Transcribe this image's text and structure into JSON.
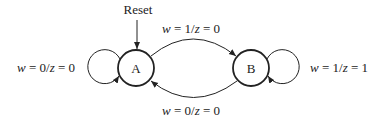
{
  "diagram": {
    "type": "finite-state-machine",
    "reset_label": "Reset",
    "reset_target": "A",
    "states": [
      {
        "id": "A",
        "label": "A"
      },
      {
        "id": "B",
        "label": "B"
      }
    ],
    "transitions": [
      {
        "from": "A",
        "to": "A",
        "input": "0",
        "output": "0",
        "label": {
          "w": "w",
          "eq1": " = 0/",
          "z": "z",
          "eq2": " = 0"
        }
      },
      {
        "from": "A",
        "to": "B",
        "input": "1",
        "output": "0",
        "label": {
          "w": "w",
          "eq1": " = 1/",
          "z": "z",
          "eq2": " = 0"
        }
      },
      {
        "from": "B",
        "to": "A",
        "input": "0",
        "output": "0",
        "label": {
          "w": "w",
          "eq1": " = 0/",
          "z": "z",
          "eq2": " = 0"
        }
      },
      {
        "from": "B",
        "to": "B",
        "input": "1",
        "output": "1",
        "label": {
          "w": "w",
          "eq1": " = 1/",
          "z": "z",
          "eq2": " = 1"
        }
      }
    ],
    "colors": {
      "stroke": "#222222",
      "background": "#ffffff"
    }
  }
}
